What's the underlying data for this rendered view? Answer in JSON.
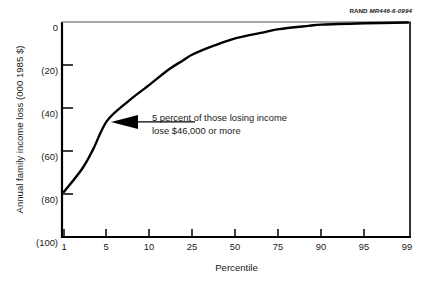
{
  "source_credit": {
    "org": "RAND",
    "figure_id": "MR446-6-0994"
  },
  "annotation": {
    "line1": "5 percent of those losing income",
    "line2": "lose $46,000 or more"
  },
  "colors": {
    "line": "#000000",
    "axis": "#000000",
    "background": "#ffffff",
    "text": "#1a1a1a"
  },
  "chart_data": {
    "type": "line",
    "title": "",
    "subtitle": "",
    "xlabel": "Percentile",
    "ylabel": "Annual family income loss (000 1985 $)",
    "x_scale": "probit",
    "grid": false,
    "legend": "none",
    "x_ticks": [
      1,
      5,
      10,
      25,
      50,
      75,
      90,
      95,
      99
    ],
    "x_tick_labels": [
      "1",
      "5",
      "10",
      "25",
      "50",
      "75",
      "90",
      "95",
      "99"
    ],
    "y_ticks": [
      0,
      -20,
      -40,
      -60,
      -80,
      -100
    ],
    "y_tick_labels": [
      "0",
      "(20)",
      "(40)",
      "(60)",
      "(80)",
      "(100)"
    ],
    "xlim": [
      1,
      99
    ],
    "ylim": [
      -100,
      0
    ],
    "series": [
      {
        "name": "Annual family income loss",
        "x": [
          1,
          2,
          3,
          5,
          7,
          10,
          15,
          20,
          25,
          35,
          50,
          65,
          75,
          85,
          90,
          95,
          99
        ],
        "values": [
          -79,
          -68,
          -59,
          -46,
          -37,
          -29,
          -22,
          -18,
          -15,
          -11,
          -7.5,
          -4.8,
          -3.3,
          -1.8,
          -1.2,
          -0.6,
          -0.2
        ]
      }
    ],
    "annotations": [
      {
        "text": "5 percent of those losing income lose $46,000 or more",
        "point_x": 5,
        "point_y": -46
      }
    ]
  }
}
